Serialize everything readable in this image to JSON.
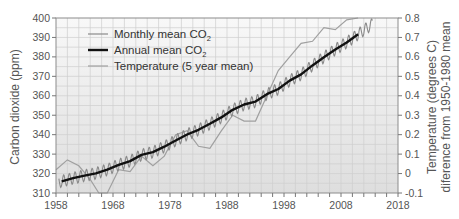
{
  "chart_data": {
    "type": "line",
    "title": "",
    "xlabel": "",
    "ylabel": "Carbon dioxide (ppm)",
    "ylabel_right_line1": "Temperature (degrees C)",
    "ylabel_right_line2": "diference  from 1950-1980 mean",
    "xlim": [
      1958,
      2018
    ],
    "ylim": [
      310,
      400
    ],
    "ylim_right": [
      -0.1,
      0.8
    ],
    "grid": true,
    "legend_position": "upper-left",
    "x_ticks": [
      "1958",
      "1968",
      "1978",
      "1988",
      "1998",
      "2008",
      "2018"
    ],
    "y_ticks": [
      "310",
      "320",
      "330",
      "340",
      "350",
      "360",
      "370",
      "380",
      "390",
      "400"
    ],
    "y_ticks_right": [
      "-0.1",
      "0",
      "0.1",
      "0.2",
      "0.3",
      "0.4",
      "0.5",
      "0.6",
      "0.7",
      "0.8"
    ],
    "legend": [
      {
        "label": "Monthly mean CO",
        "sub": "2",
        "color": "#8a8a8a",
        "width": 1.2
      },
      {
        "label": "Annual  mean  CO",
        "sub": "2",
        "color": "#111111",
        "width": 2.4
      },
      {
        "label": "Temperature (5 year mean)",
        "sub": "",
        "color": "#a0a0a0",
        "width": 1.2
      }
    ],
    "series": [
      {
        "name": "Annual mean CO2",
        "axis": "left",
        "x": [
          1959,
          1961,
          1963,
          1965,
          1967,
          1969,
          1971,
          1973,
          1975,
          1977,
          1979,
          1981,
          1983,
          1985,
          1987,
          1989,
          1991,
          1993,
          1995,
          1997,
          1999,
          2001,
          2003,
          2005,
          2007,
          2009,
          2011
        ],
        "values": [
          316,
          317.6,
          318.9,
          320.1,
          322,
          324.5,
          326.4,
          329.6,
          331,
          333.8,
          337,
          340.1,
          342.5,
          345.6,
          348.9,
          352.8,
          355.5,
          357,
          360.8,
          363.5,
          367.8,
          371,
          375.6,
          379.8,
          383.8,
          387.4,
          391.6
        ]
      },
      {
        "name": "Monthly mean CO2",
        "axis": "left",
        "description": "annual mean with seasonal oscillation of about ±3 ppm",
        "x_range": [
          1958.5,
          2013.5
        ],
        "seasonal_amplitude": 3
      },
      {
        "name": "Temperature (5 year mean)",
        "axis": "right",
        "x": [
          1958,
          1960,
          1962,
          1964,
          1965.5,
          1967,
          1969,
          1971,
          1973,
          1975,
          1977,
          1979,
          1981,
          1983,
          1985,
          1987,
          1989,
          1991,
          1993,
          1995,
          1997,
          1999,
          2001,
          2003,
          2005,
          2007,
          2009,
          2011
        ],
        "values": [
          0.02,
          0.07,
          0.04,
          -0.03,
          -0.1,
          -0.1,
          0.02,
          0.01,
          0.09,
          0.04,
          0.09,
          0.2,
          0.22,
          0.14,
          0.13,
          0.22,
          0.3,
          0.27,
          0.27,
          0.4,
          0.53,
          0.6,
          0.67,
          0.68,
          0.75,
          0.74,
          0.79,
          0.8
        ]
      }
    ]
  }
}
